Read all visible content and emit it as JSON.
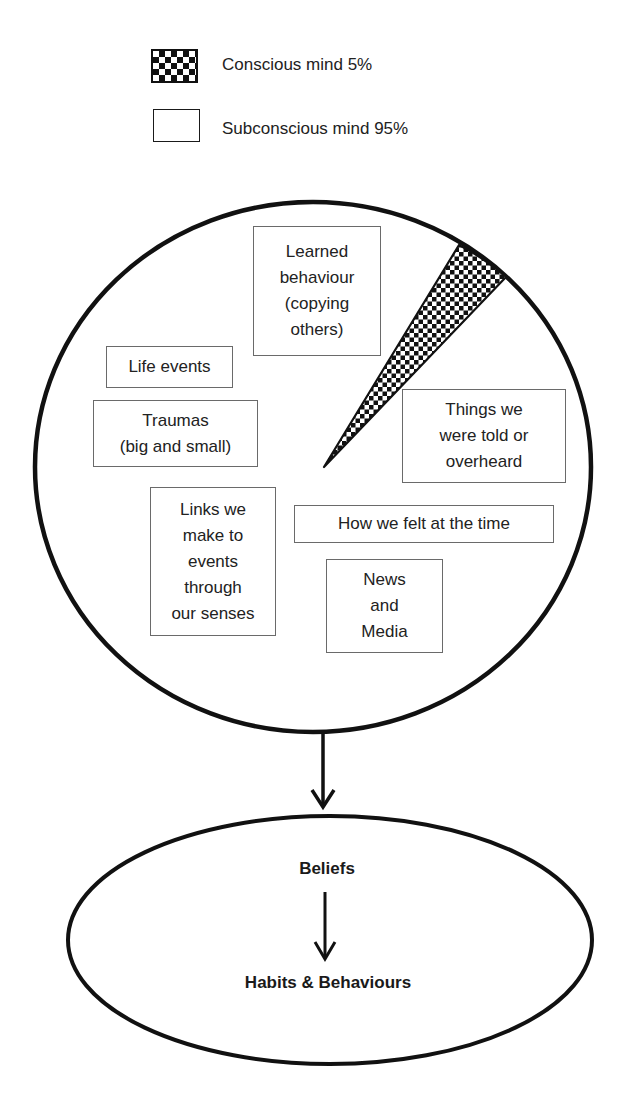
{
  "legend": {
    "items": [
      {
        "label": "Conscious mind 5%",
        "pattern": "checkerboard",
        "share_percent": 5
      },
      {
        "label": "Subconscious mind 95%",
        "pattern": "blank",
        "share_percent": 95
      }
    ]
  },
  "mind_circle": {
    "conscious_share_percent": 5,
    "subconscious_share_percent": 95,
    "influences": [
      {
        "id": "learned",
        "label": "Learned\nbehaviour\n(copying\nothers)"
      },
      {
        "id": "life-events",
        "label": "Life events"
      },
      {
        "id": "traumas",
        "label": "Traumas\n(big and small)"
      },
      {
        "id": "things-told",
        "label": "Things we\nwere told or\noverheard"
      },
      {
        "id": "links-senses",
        "label": "Links we\nmake to\nevents\nthrough\nour senses"
      },
      {
        "id": "how-felt",
        "label": "How we felt at the time"
      },
      {
        "id": "news-media",
        "label": "News\nand\nMedia"
      }
    ]
  },
  "outcome_ellipse": {
    "top_label": "Beliefs",
    "bottom_label": "Habits & Behaviours"
  },
  "colors": {
    "stroke": "#111111",
    "box_border": "#6a6a6a",
    "text": "#222222",
    "background": "#ffffff"
  }
}
